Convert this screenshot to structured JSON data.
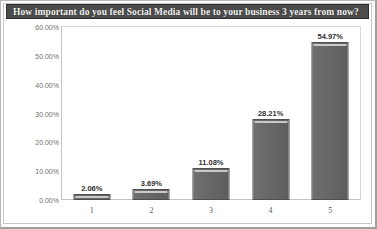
{
  "title": "How important do you feel Social Media will be to your business 3 years from now?",
  "colors": {
    "title_banner_bg": "#4c4c4c",
    "title_text": "#f2f2f2",
    "bar_fill": "#6a6a6a",
    "bar_border": "#4f4f4f",
    "bar_highlight": "#c9c9c9",
    "plot_bg": "#ffffff",
    "axis_line": "#c4c4c4",
    "tick_text": "#6e6e6e",
    "label_text": "#2f2f2f",
    "frame_bg": "#fdfdfd"
  },
  "chart_data": {
    "type": "bar",
    "title": "How important do you feel Social Media will be to your business 3 years from now?",
    "xlabel": "",
    "ylabel": "",
    "categories": [
      "1",
      "2",
      "3",
      "4",
      "5"
    ],
    "values": [
      2.06,
      3.69,
      11.08,
      28.21,
      54.97
    ],
    "value_labels": [
      "2.06%",
      "3.69%",
      "11.08%",
      "28.21%",
      "54.97%"
    ],
    "ylim": [
      0,
      60
    ],
    "ytick_values": [
      0,
      10,
      20,
      30,
      40,
      50,
      60
    ],
    "ytick_labels": [
      "0.00%",
      "10.00%",
      "20.00%",
      "30.00%",
      "40.00%",
      "50.00%",
      "60.00%"
    ],
    "grid": false,
    "legend": false,
    "series": [
      {
        "name": "Response share",
        "values": [
          2.06,
          3.69,
          11.08,
          28.21,
          54.97
        ]
      }
    ]
  }
}
